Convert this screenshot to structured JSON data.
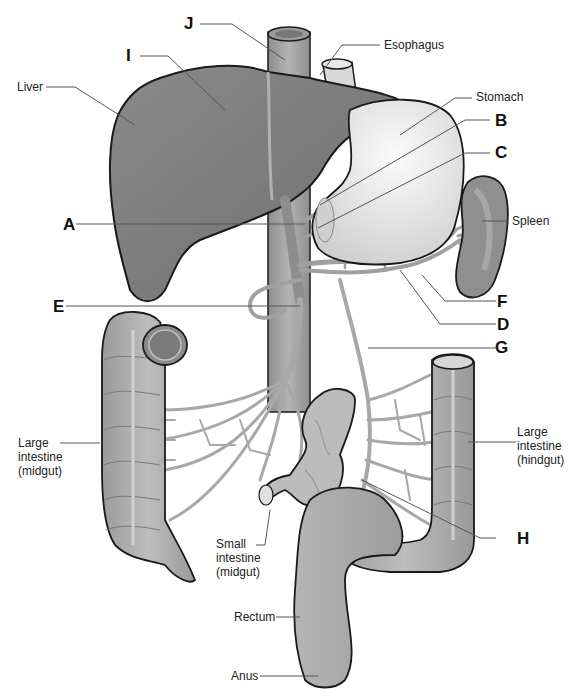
{
  "diagram": {
    "colors": {
      "liver": "#7f7f7f",
      "liver_outline": "#1a1a1a",
      "stomach": "#e6e6e6",
      "spleen": "#8f8f8f",
      "intestine": "#a8a8a8",
      "vessel": "#a0a0a0",
      "leader_line": "#555555",
      "background": "#ffffff"
    },
    "organ_labels": {
      "liver": "Liver",
      "esophagus": "Esophagus",
      "stomach": "Stomach",
      "spleen": "Spleen",
      "large_intestine_midgut": "Large\nintestine\n(midgut)",
      "large_intestine_hindgut": "Large\nintestine\n(hindgut)",
      "small_intestine_midgut": "Small\nintestine\n(midgut)",
      "rectum": "Rectum",
      "anus": "Anus"
    },
    "letter_labels": {
      "A": "A",
      "B": "B",
      "C": "C",
      "D": "D",
      "E": "E",
      "F": "F",
      "G": "G",
      "H": "H",
      "I": "I",
      "J": "J"
    }
  }
}
